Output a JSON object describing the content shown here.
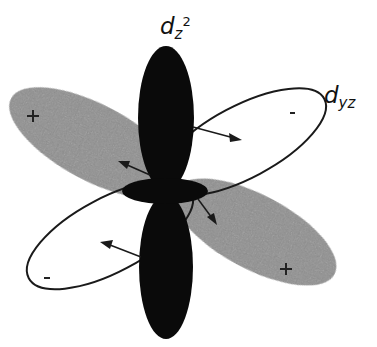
{
  "diagram": {
    "labels": {
      "dz2": {
        "main": "d",
        "sub": "z",
        "sup": "2"
      },
      "dyz": {
        "main": "d",
        "sub": "yz"
      }
    },
    "signs": {
      "upper_left_lobe": "+",
      "upper_right_lobe": "-",
      "lower_left_lobe": "-",
      "lower_right_lobe": "+"
    },
    "colors": {
      "background": "#ffffff",
      "dz2_lobes": "#0a0a0a",
      "shaded_lobes": "#8a8a8a",
      "outline": "#1a1a1a"
    }
  }
}
